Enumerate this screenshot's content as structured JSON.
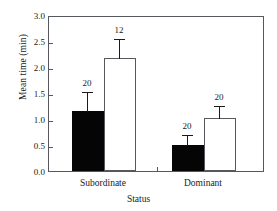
{
  "chart_data": {
    "type": "bar",
    "title": "",
    "xlabel": "Status",
    "ylabel": "Mean time (min)",
    "ylim": [
      0.0,
      3.0
    ],
    "ytick_labels": [
      "0.0",
      "0.5",
      "1.0",
      "1.5",
      "2.0",
      "2.5",
      "3.0"
    ],
    "ytick_values": [
      0.0,
      0.5,
      1.0,
      1.5,
      2.0,
      2.5,
      3.0
    ],
    "grid": false,
    "legend": "none",
    "categories": [
      "Subordinate",
      "Dominant"
    ],
    "series": [
      {
        "name": "filled",
        "fill": "#050505",
        "values": [
          1.15,
          0.5
        ],
        "errors": [
          0.38,
          0.21
        ],
        "sample_labels": [
          "20",
          "20"
        ]
      },
      {
        "name": "open",
        "fill": "#ffffff",
        "values": [
          2.18,
          1.01
        ],
        "errors": [
          0.37,
          0.25
        ],
        "sample_labels": [
          "12",
          "20"
        ]
      }
    ],
    "annotations": [
      "20",
      "12",
      "20",
      "20"
    ]
  },
  "axis": {
    "frame_color": "#55585c",
    "text_color": "#1a1a1a"
  }
}
